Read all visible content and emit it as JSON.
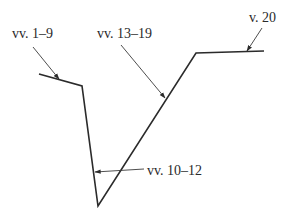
{
  "diagram": {
    "type": "plot-structure-line",
    "path_points": [
      [
        39,
        74
      ],
      [
        82,
        86
      ],
      [
        98,
        206
      ],
      [
        196,
        53
      ],
      [
        264,
        51
      ]
    ],
    "labels": [
      {
        "id": "vv-1-9",
        "text": "vv. 1–9",
        "x": 12,
        "y": 38,
        "leader_from": [
          33,
          47
        ],
        "leader_to": [
          59,
          79
        ]
      },
      {
        "id": "vv-13-19",
        "text": "vv. 13–19",
        "x": 97,
        "y": 38,
        "leader_from": [
          121,
          45
        ],
        "leader_to": [
          165,
          98
        ]
      },
      {
        "id": "v-20",
        "text": "v. 20",
        "x": 249,
        "y": 22,
        "leader_from": [
          262,
          28
        ],
        "leader_to": [
          247,
          51
        ]
      },
      {
        "id": "vv-10-12",
        "text": "vv. 10–12",
        "x": 147,
        "y": 175,
        "leader_from": [
          144,
          169
        ],
        "leader_to": [
          95,
          172
        ]
      }
    ],
    "colors": {
      "line": "#2b2b2b",
      "text": "#2a2a2a",
      "background": "#ffffff"
    }
  }
}
